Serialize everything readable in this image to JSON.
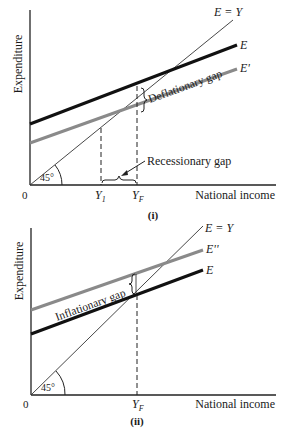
{
  "figure": {
    "panels": [
      {
        "id": "i",
        "caption": "(i)",
        "y_axis_label": "Expenditure",
        "x_axis_label": "National income",
        "origin_label": "0",
        "angle_label": "45°",
        "lines": [
          {
            "label": "E = Y",
            "style": "thin",
            "color": "#222222"
          },
          {
            "label": "E",
            "style": "thick",
            "color": "#111111"
          },
          {
            "label": "E'",
            "style": "thick",
            "color": "#8a8a8a"
          }
        ],
        "x_ticks": [
          "Y1",
          "YF"
        ],
        "x_tick_main": [
          "Y",
          "Y"
        ],
        "x_tick_sub": [
          "1",
          "F"
        ],
        "annotations": [
          "Deflationary gap",
          "Recessionary gap"
        ]
      },
      {
        "id": "ii",
        "caption": "(ii)",
        "y_axis_label": "Expenditure",
        "x_axis_label": "National income",
        "origin_label": "0",
        "angle_label": "45°",
        "lines": [
          {
            "label": "E = Y",
            "style": "thin",
            "color": "#222222"
          },
          {
            "label": "E''",
            "style": "thick",
            "color": "#8a8a8a"
          },
          {
            "label": "E",
            "style": "thick",
            "color": "#111111"
          }
        ],
        "x_ticks": [
          "YF"
        ],
        "x_tick_main": [
          "Y"
        ],
        "x_tick_sub": [
          "F"
        ],
        "annotations": [
          "Inflationary gap"
        ]
      }
    ]
  }
}
